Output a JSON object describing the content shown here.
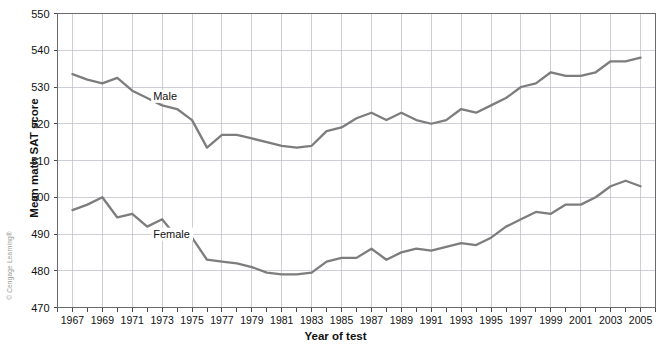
{
  "copyright": "© Cengage Learning®",
  "chart_data": {
    "type": "line",
    "title": "",
    "xlabel": "Year of test",
    "ylabel": "Mean math SAT score",
    "xlim": [
      1966,
      2006
    ],
    "ylim": [
      470,
      550
    ],
    "ytick_step": 10,
    "xtick_step": 2,
    "grid": true,
    "legend_position": "inline-labels",
    "line_color": "#7d7d7d",
    "grid_color": "#b9b9c4",
    "frame_color": "#6a6a6a",
    "ytick_labels": [
      "470",
      "480",
      "490",
      "500",
      "510",
      "520",
      "530",
      "540",
      "550"
    ],
    "xtick_labels": [
      "1967",
      "1969",
      "1971",
      "1973",
      "1975",
      "1977",
      "1979",
      "1981",
      "1983",
      "1985",
      "1987",
      "1989",
      "1991",
      "1993",
      "1995",
      "1997",
      "1999",
      "2001",
      "2003",
      "2005"
    ],
    "x": [
      1967,
      1968,
      1969,
      1970,
      1971,
      1972,
      1973,
      1974,
      1975,
      1976,
      1977,
      1978,
      1979,
      1980,
      1981,
      1982,
      1983,
      1984,
      1985,
      1986,
      1987,
      1988,
      1989,
      1990,
      1991,
      1992,
      1993,
      1994,
      1995,
      1996,
      1997,
      1998,
      1999,
      2000,
      2001,
      2002,
      2003,
      2004,
      2005
    ],
    "series": [
      {
        "name": "Male",
        "label": "Male",
        "label_x": 1972.4,
        "label_y": 526.5,
        "values": [
          533.5,
          532.0,
          531.0,
          532.5,
          529.0,
          527.0,
          525.0,
          524.0,
          521.0,
          513.5,
          517.0,
          517.0,
          516.0,
          515.0,
          514.0,
          513.5,
          514.0,
          518.0,
          519.0,
          521.5,
          523.0,
          521.0,
          523.0,
          521.0,
          520.0,
          521.0,
          524.0,
          523.0,
          525.0,
          527.0,
          530.0,
          531.0,
          534.0,
          533.0,
          533.0,
          534.0,
          537.0,
          537.0,
          538.0
        ]
      },
      {
        "name": "Female",
        "label": "Female",
        "label_x": 1972.4,
        "label_y": 489.0,
        "values": [
          496.5,
          498.0,
          500.0,
          494.5,
          495.5,
          492.0,
          494.0,
          489.0,
          489.0,
          483.0,
          482.5,
          482.0,
          481.0,
          479.5,
          479.0,
          479.0,
          479.5,
          482.5,
          483.5,
          483.5,
          486.0,
          483.0,
          485.0,
          486.0,
          485.5,
          486.5,
          487.5,
          487.0,
          489.0,
          492.0,
          494.0,
          496.0,
          495.5,
          498.0,
          498.0,
          500.0,
          503.0,
          504.5,
          503.0
        ]
      }
    ]
  }
}
